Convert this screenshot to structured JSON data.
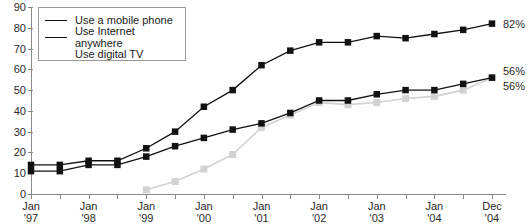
{
  "chart_data": {
    "type": "line",
    "title": "",
    "xlabel": "",
    "ylabel": "",
    "ylim": [
      0,
      90
    ],
    "ytick_values": [
      0,
      10,
      20,
      30,
      40,
      50,
      60,
      70,
      80,
      90
    ],
    "ytick_labels": [
      "0",
      "10",
      "20",
      "30",
      "40",
      "50",
      "60",
      "70",
      "80",
      "90"
    ],
    "grid": false,
    "legend_position": "top-left",
    "x_axis": {
      "tick_interval_months": 6,
      "labeled_ticks": [
        {
          "line1": "Jan",
          "line2": "'97"
        },
        {
          "line1": "Jan",
          "line2": "'98"
        },
        {
          "line1": "Jan",
          "line2": "'99"
        },
        {
          "line1": "Jan",
          "line2": "'00"
        },
        {
          "line1": "Jan",
          "line2": "'01"
        },
        {
          "line1": "Jan",
          "line2": "'02"
        },
        {
          "line1": "Jan",
          "line2": "'03"
        },
        {
          "line1": "Jan",
          "line2": "'04"
        },
        {
          "line1": "Dec",
          "line2": "'04"
        }
      ]
    },
    "x": [
      "Jan '97",
      "Jul '97",
      "Jan '98",
      "Jul '98",
      "Jan '99",
      "Jul '99",
      "Jan '00",
      "Jul '00",
      "Jan '01",
      "Jul '01",
      "Jan '02",
      "Jul '02",
      "Jan '03",
      "Jul '03",
      "Jan '04",
      "Jul '04",
      "Dec '04"
    ],
    "series": [
      {
        "name": "Use a mobile phone",
        "color": "#111111",
        "marker": "square",
        "values": [
          14,
          14,
          16,
          16,
          22,
          30,
          42,
          50,
          62,
          69,
          73,
          73,
          76,
          75,
          77,
          79,
          82
        ],
        "end_label": "82%"
      },
      {
        "name": "Use Internet anywhere",
        "color": "#111111",
        "marker": "square",
        "values": [
          11,
          11,
          14,
          14,
          18,
          23,
          27,
          31,
          34,
          39,
          45,
          45,
          48,
          50,
          50,
          53,
          56
        ],
        "end_label": "56%"
      },
      {
        "name": "Use digital TV",
        "color": "#d2d2d2",
        "marker": "square",
        "values": [
          null,
          null,
          null,
          null,
          2,
          6,
          12,
          19,
          32,
          38,
          44,
          43,
          44,
          46,
          47,
          50,
          56
        ],
        "end_label": "56%"
      }
    ]
  },
  "legend": {
    "items": [
      {
        "label": "Use a mobile phone"
      },
      {
        "label": "Use Internet anywhere"
      },
      {
        "label": "Use digital TV"
      }
    ]
  },
  "end_labels": {
    "mobile": "82%",
    "internet": "56%",
    "digital_tv": "56%"
  }
}
